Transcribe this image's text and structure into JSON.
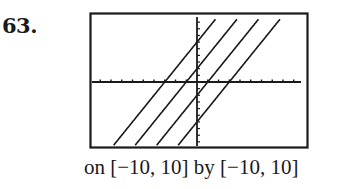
{
  "problem": {
    "number": "63."
  },
  "caption": "on [−10, 10] by [−10, 10]",
  "colors": {
    "ink": "#1a1a1a",
    "background": "#ffffff"
  },
  "chart_data": {
    "type": "line",
    "title": "",
    "xlabel": "",
    "ylabel": "",
    "xlim": [
      -10,
      10
    ],
    "ylim": [
      -10,
      10
    ],
    "xscl": 1,
    "yscl": 1,
    "grid": false,
    "legend": null,
    "style": "graphing-calculator viewing window with tick marks on axes",
    "window_text": "on [−10, 10] by [−10, 10]",
    "series": [
      {
        "name": "y = 2x + 6",
        "slope": 2,
        "intercept": 6,
        "x": [
          -7.7,
          1.7
        ],
        "y": [
          -9.4,
          9.4
        ]
      },
      {
        "name": "y = 2x + 2",
        "slope": 2,
        "intercept": 2,
        "x": [
          -5.7,
          3.7
        ],
        "y": [
          -9.4,
          9.4
        ]
      },
      {
        "name": "y = 2x - 2",
        "slope": 2,
        "intercept": -2,
        "x": [
          -3.7,
          5.7
        ],
        "y": [
          -9.4,
          9.4
        ]
      },
      {
        "name": "y = 2x - 6",
        "slope": 2,
        "intercept": -6,
        "x": [
          -1.7,
          7.7
        ],
        "y": [
          -9.4,
          9.4
        ]
      }
    ],
    "x_intercepts": [
      -3,
      -1,
      1,
      3
    ],
    "y_intercepts": [
      6,
      2,
      -2,
      -6
    ]
  }
}
